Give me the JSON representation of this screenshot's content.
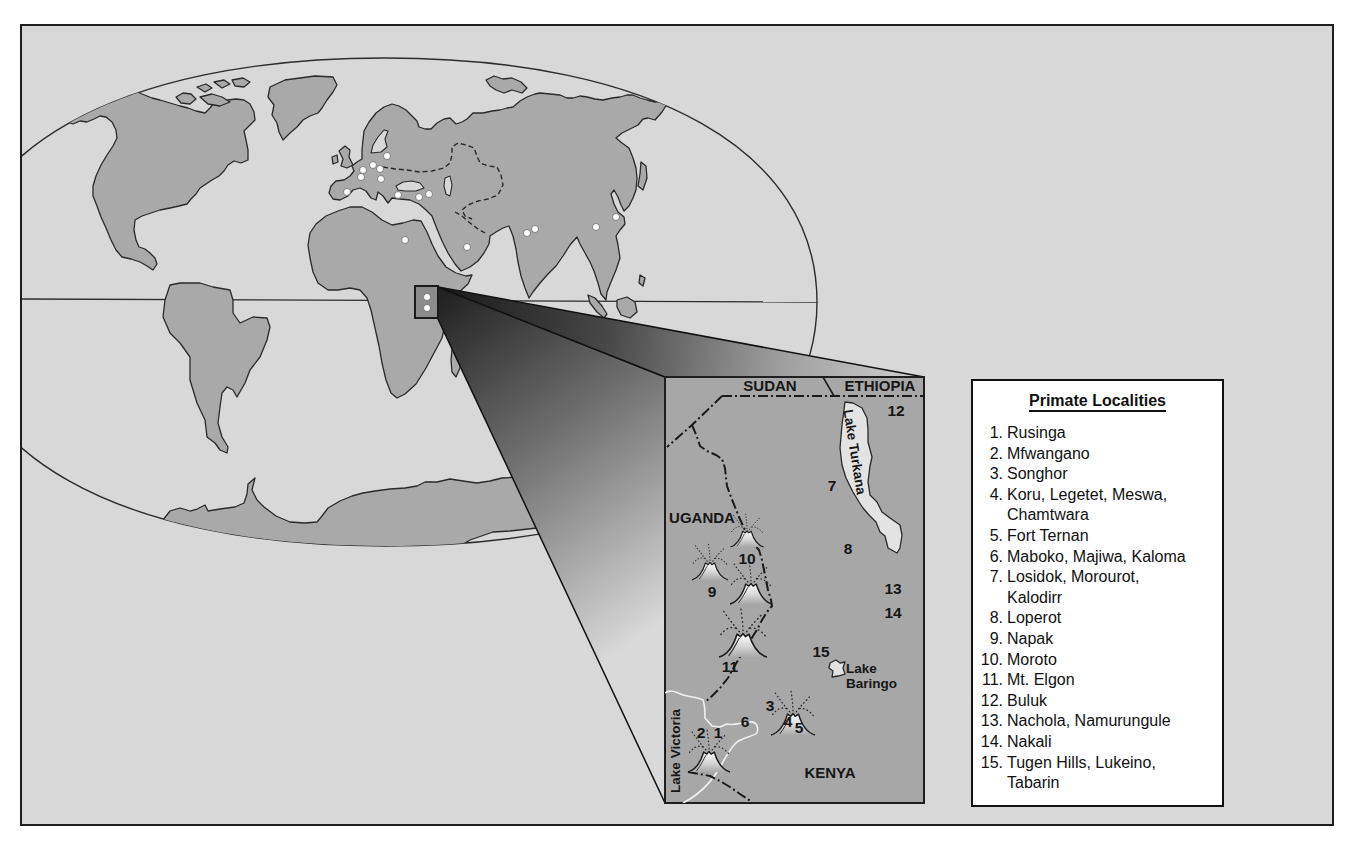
{
  "colors": {
    "frame_background": "#d8d8d8",
    "land": "#a9a9a9",
    "inset_background": "#a7a7a7",
    "lake": "#e3e3e3",
    "legend_background": "#ffffff",
    "outline": "#1e1e1e"
  },
  "world_map": {
    "fossil_sites": [
      {
        "x": 387,
        "y": 156
      },
      {
        "x": 373,
        "y": 165
      },
      {
        "x": 363,
        "y": 170
      },
      {
        "x": 380,
        "y": 169
      },
      {
        "x": 361,
        "y": 177
      },
      {
        "x": 381,
        "y": 179
      },
      {
        "x": 347,
        "y": 192
      },
      {
        "x": 398,
        "y": 195
      },
      {
        "x": 419,
        "y": 197
      },
      {
        "x": 429,
        "y": 194
      },
      {
        "x": 405,
        "y": 240
      },
      {
        "x": 467,
        "y": 247
      },
      {
        "x": 527,
        "y": 233
      },
      {
        "x": 535,
        "y": 229
      },
      {
        "x": 596,
        "y": 227
      },
      {
        "x": 616,
        "y": 217
      }
    ],
    "inset_marker_sites": [
      {
        "x": 427,
        "y": 297
      },
      {
        "x": 427,
        "y": 308
      }
    ]
  },
  "inset": {
    "country_labels": {
      "sudan": "SUDAN",
      "ethiopia": "ETHIOPIA",
      "uganda": "UGANDA",
      "kenya": "KENYA"
    },
    "lake_labels": {
      "turkana": "Lake Turkana",
      "baringo": [
        "Lake",
        "Baringo"
      ],
      "victoria": "Lake Victoria"
    },
    "locality_numbers": [
      "1",
      "2",
      "3",
      "4",
      "5",
      "6",
      "7",
      "8",
      "9",
      "10",
      "11",
      "12",
      "13",
      "14",
      "15"
    ]
  },
  "legend": {
    "title": "Primate Localities",
    "items": [
      {
        "num": "1.",
        "lines": [
          "Rusinga"
        ]
      },
      {
        "num": "2.",
        "lines": [
          "Mfwangano"
        ]
      },
      {
        "num": "3.",
        "lines": [
          "Songhor"
        ]
      },
      {
        "num": "4.",
        "lines": [
          "Koru, Legetet, Meswa,",
          "Chamtwara"
        ]
      },
      {
        "num": "5.",
        "lines": [
          "Fort Ternan"
        ]
      },
      {
        "num": "6.",
        "lines": [
          "Maboko, Majiwa, Kaloma"
        ]
      },
      {
        "num": "7.",
        "lines": [
          "Losidok, Morourot,",
          "Kalodirr"
        ]
      },
      {
        "num": "8.",
        "lines": [
          "Loperot"
        ]
      },
      {
        "num": "9.",
        "lines": [
          "Napak"
        ]
      },
      {
        "num": "10.",
        "lines": [
          "Moroto"
        ]
      },
      {
        "num": "11.",
        "lines": [
          "Mt. Elgon"
        ]
      },
      {
        "num": "12.",
        "lines": [
          "Buluk"
        ]
      },
      {
        "num": "13.",
        "lines": [
          "Nachola, Namurungule"
        ]
      },
      {
        "num": "14.",
        "lines": [
          "Nakali"
        ]
      },
      {
        "num": "15.",
        "lines": [
          "Tugen Hills, Lukeino,",
          "Tabarin"
        ]
      }
    ]
  }
}
